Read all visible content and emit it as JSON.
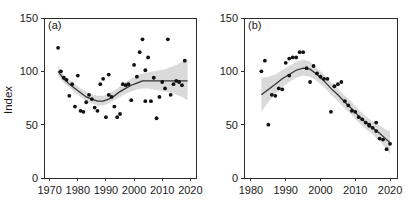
{
  "figure": {
    "background": "#ffffff",
    "point_color": "#111111",
    "line_color": "#333333",
    "band_color": "#cfcfcf",
    "axis_color": "#2b2b2b"
  },
  "chart_data": [
    {
      "type": "scatter",
      "panel": "a",
      "panel_label": "(a)",
      "title": "",
      "xlabel": "",
      "ylabel": "Index",
      "xlim": [
        1968,
        2022
      ],
      "ylim": [
        0,
        150
      ],
      "xticks": [
        1970,
        1980,
        1990,
        2000,
        2010,
        2020
      ],
      "yticks": [
        0,
        50,
        100,
        150
      ],
      "grid": false,
      "legend": "none",
      "points": [
        {
          "x": 1973,
          "y": 122
        },
        {
          "x": 1974,
          "y": 100
        },
        {
          "x": 1975,
          "y": 94
        },
        {
          "x": 1976,
          "y": 92
        },
        {
          "x": 1977,
          "y": 77
        },
        {
          "x": 1978,
          "y": 88
        },
        {
          "x": 1979,
          "y": 67
        },
        {
          "x": 1980,
          "y": 96
        },
        {
          "x": 1981,
          "y": 63
        },
        {
          "x": 1982,
          "y": 62
        },
        {
          "x": 1983,
          "y": 71
        },
        {
          "x": 1984,
          "y": 78
        },
        {
          "x": 1985,
          "y": 74
        },
        {
          "x": 1986,
          "y": 66
        },
        {
          "x": 1987,
          "y": 63
        },
        {
          "x": 1988,
          "y": 88
        },
        {
          "x": 1989,
          "y": 93
        },
        {
          "x": 1990,
          "y": 57
        },
        {
          "x": 1991,
          "y": 78
        },
        {
          "x": 1991,
          "y": 97
        },
        {
          "x": 1992,
          "y": 76
        },
        {
          "x": 1993,
          "y": 67
        },
        {
          "x": 1994,
          "y": 57
        },
        {
          "x": 1995,
          "y": 60
        },
        {
          "x": 1996,
          "y": 88
        },
        {
          "x": 1997,
          "y": 87
        },
        {
          "x": 1998,
          "y": 88
        },
        {
          "x": 1999,
          "y": 73
        },
        {
          "x": 2000,
          "y": 106
        },
        {
          "x": 2001,
          "y": 95
        },
        {
          "x": 2002,
          "y": 118
        },
        {
          "x": 2003,
          "y": 130
        },
        {
          "x": 2004,
          "y": 101
        },
        {
          "x": 2004,
          "y": 72
        },
        {
          "x": 2005,
          "y": 113
        },
        {
          "x": 2006,
          "y": 72
        },
        {
          "x": 2007,
          "y": 94
        },
        {
          "x": 2008,
          "y": 56
        },
        {
          "x": 2009,
          "y": 76
        },
        {
          "x": 2010,
          "y": 90
        },
        {
          "x": 2011,
          "y": 84
        },
        {
          "x": 2012,
          "y": 130
        },
        {
          "x": 2013,
          "y": 78
        },
        {
          "x": 2014,
          "y": 88
        },
        {
          "x": 2015,
          "y": 91
        },
        {
          "x": 2016,
          "y": 90
        },
        {
          "x": 2017,
          "y": 87
        },
        {
          "x": 2018,
          "y": 110
        }
      ],
      "fit_curve": [
        {
          "x": 1973,
          "y": 100,
          "lo": 96,
          "hi": 105
        },
        {
          "x": 1975,
          "y": 93,
          "lo": 89,
          "hi": 97
        },
        {
          "x": 1977,
          "y": 88,
          "lo": 85,
          "hi": 92
        },
        {
          "x": 1979,
          "y": 84,
          "lo": 80,
          "hi": 88
        },
        {
          "x": 1981,
          "y": 80,
          "lo": 76,
          "hi": 84
        },
        {
          "x": 1983,
          "y": 76,
          "lo": 72,
          "hi": 81
        },
        {
          "x": 1985,
          "y": 74,
          "lo": 70,
          "hi": 78
        },
        {
          "x": 1987,
          "y": 72,
          "lo": 68,
          "hi": 77
        },
        {
          "x": 1989,
          "y": 72,
          "lo": 68,
          "hi": 77
        },
        {
          "x": 1991,
          "y": 74,
          "lo": 70,
          "hi": 79
        },
        {
          "x": 1993,
          "y": 77,
          "lo": 73,
          "hi": 82
        },
        {
          "x": 1995,
          "y": 81,
          "lo": 76,
          "hi": 86
        },
        {
          "x": 1997,
          "y": 84,
          "lo": 79,
          "hi": 90
        },
        {
          "x": 1999,
          "y": 87,
          "lo": 81,
          "hi": 93
        },
        {
          "x": 2001,
          "y": 89,
          "lo": 83,
          "hi": 96
        },
        {
          "x": 2003,
          "y": 91,
          "lo": 84,
          "hi": 98
        },
        {
          "x": 2005,
          "y": 91,
          "lo": 84,
          "hi": 99
        },
        {
          "x": 2007,
          "y": 91,
          "lo": 83,
          "hi": 100
        },
        {
          "x": 2009,
          "y": 91,
          "lo": 82,
          "hi": 101
        },
        {
          "x": 2011,
          "y": 91,
          "lo": 81,
          "hi": 102
        },
        {
          "x": 2013,
          "y": 91,
          "lo": 80,
          "hi": 104
        },
        {
          "x": 2015,
          "y": 91,
          "lo": 78,
          "hi": 106
        },
        {
          "x": 2017,
          "y": 91,
          "lo": 76,
          "hi": 109
        },
        {
          "x": 2019,
          "y": 91,
          "lo": 73,
          "hi": 112
        }
      ]
    },
    {
      "type": "scatter",
      "panel": "b",
      "panel_label": "(b)",
      "title": "",
      "xlabel": "",
      "ylabel": "",
      "xlim": [
        1978,
        2022
      ],
      "ylim": [
        0,
        150
      ],
      "xticks": [
        1980,
        1990,
        2000,
        2010,
        2020
      ],
      "yticks": [
        0,
        50,
        100,
        150
      ],
      "grid": false,
      "legend": "none",
      "points": [
        {
          "x": 1983,
          "y": 100
        },
        {
          "x": 1984,
          "y": 110
        },
        {
          "x": 1985,
          "y": 50
        },
        {
          "x": 1986,
          "y": 78
        },
        {
          "x": 1987,
          "y": 77
        },
        {
          "x": 1988,
          "y": 84
        },
        {
          "x": 1989,
          "y": 83
        },
        {
          "x": 1990,
          "y": 108
        },
        {
          "x": 1991,
          "y": 112
        },
        {
          "x": 1991,
          "y": 96
        },
        {
          "x": 1992,
          "y": 113
        },
        {
          "x": 1993,
          "y": 113
        },
        {
          "x": 1994,
          "y": 118
        },
        {
          "x": 1995,
          "y": 118
        },
        {
          "x": 1996,
          "y": 103
        },
        {
          "x": 1997,
          "y": 90
        },
        {
          "x": 1998,
          "y": 105
        },
        {
          "x": 1999,
          "y": 98
        },
        {
          "x": 2000,
          "y": 95
        },
        {
          "x": 2001,
          "y": 93
        },
        {
          "x": 2002,
          "y": 93
        },
        {
          "x": 2003,
          "y": 62
        },
        {
          "x": 2004,
          "y": 86
        },
        {
          "x": 2005,
          "y": 88
        },
        {
          "x": 2006,
          "y": 90
        },
        {
          "x": 2007,
          "y": 72
        },
        {
          "x": 2008,
          "y": 68
        },
        {
          "x": 2009,
          "y": 63
        },
        {
          "x": 2010,
          "y": 62
        },
        {
          "x": 2011,
          "y": 57
        },
        {
          "x": 2012,
          "y": 55
        },
        {
          "x": 2013,
          "y": 52
        },
        {
          "x": 2014,
          "y": 50
        },
        {
          "x": 2014,
          "y": 49
        },
        {
          "x": 2015,
          "y": 47
        },
        {
          "x": 2016,
          "y": 44
        },
        {
          "x": 2016,
          "y": 52
        },
        {
          "x": 2017,
          "y": 37
        },
        {
          "x": 2018,
          "y": 36
        },
        {
          "x": 2019,
          "y": 27
        },
        {
          "x": 2020,
          "y": 32
        }
      ],
      "fit_curve": [
        {
          "x": 1983,
          "y": 78,
          "lo": 62,
          "hi": 94
        },
        {
          "x": 1985,
          "y": 83,
          "lo": 71,
          "hi": 95
        },
        {
          "x": 1987,
          "y": 88,
          "lo": 79,
          "hi": 97
        },
        {
          "x": 1989,
          "y": 93,
          "lo": 85,
          "hi": 101
        },
        {
          "x": 1991,
          "y": 97,
          "lo": 90,
          "hi": 105
        },
        {
          "x": 1993,
          "y": 101,
          "lo": 94,
          "hi": 109
        },
        {
          "x": 1995,
          "y": 103,
          "lo": 96,
          "hi": 111
        },
        {
          "x": 1997,
          "y": 102,
          "lo": 95,
          "hi": 109
        },
        {
          "x": 1999,
          "y": 97,
          "lo": 91,
          "hi": 103
        },
        {
          "x": 2001,
          "y": 91,
          "lo": 85,
          "hi": 97
        },
        {
          "x": 2003,
          "y": 84,
          "lo": 78,
          "hi": 90
        },
        {
          "x": 2005,
          "y": 78,
          "lo": 72,
          "hi": 84
        },
        {
          "x": 2007,
          "y": 71,
          "lo": 65,
          "hi": 77
        },
        {
          "x": 2009,
          "y": 65,
          "lo": 59,
          "hi": 71
        },
        {
          "x": 2011,
          "y": 58,
          "lo": 52,
          "hi": 64
        },
        {
          "x": 2013,
          "y": 52,
          "lo": 46,
          "hi": 58
        },
        {
          "x": 2015,
          "y": 47,
          "lo": 41,
          "hi": 53
        },
        {
          "x": 2017,
          "y": 42,
          "lo": 35,
          "hi": 49
        },
        {
          "x": 2019,
          "y": 36,
          "lo": 27,
          "hi": 45
        },
        {
          "x": 2020,
          "y": 33,
          "lo": 22,
          "hi": 44
        }
      ]
    }
  ]
}
